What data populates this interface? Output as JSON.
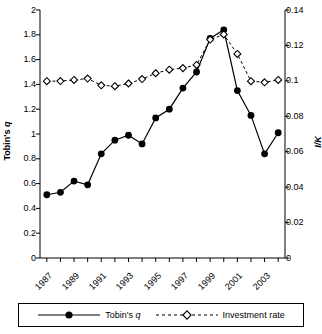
{
  "chart_data": {
    "type": "line",
    "title": "",
    "xlabel": "",
    "ylabel": "Tobin's q",
    "y2label": "I/K",
    "x": [
      1987,
      1988,
      1989,
      1990,
      1991,
      1992,
      1993,
      1994,
      1995,
      1996,
      1997,
      1998,
      1999,
      2000,
      2001,
      2002,
      2003,
      2004
    ],
    "xtick_labels": [
      "1987",
      "1989",
      "1991",
      "1993",
      "1995",
      "1997",
      "1999",
      "2001",
      "2003"
    ],
    "xtick_years": [
      1987,
      1989,
      1991,
      1993,
      1995,
      1997,
      1999,
      2001,
      2003
    ],
    "ylim": [
      0,
      2
    ],
    "ytick_labels": [
      "0",
      "0.2",
      "0.4",
      "0.6",
      "0.8",
      "1",
      "1.2",
      "1.4",
      "1.6",
      "1.8",
      "2"
    ],
    "ytick_values": [
      0,
      0.2,
      0.4,
      0.6,
      0.8,
      1,
      1.2,
      1.4,
      1.6,
      1.8,
      2
    ],
    "y2lim": [
      0,
      0.14
    ],
    "y2tick_labels": [
      "0",
      "0.02",
      "0.04",
      "0.06",
      "0.08",
      "0.1",
      "0.12",
      "0.14"
    ],
    "y2tick_values": [
      0,
      0.02,
      0.04,
      0.06,
      0.08,
      0.1,
      0.12,
      0.14
    ],
    "grid": false,
    "legend_position": "bottom",
    "series": [
      {
        "name": "Tobin's q",
        "axis": "left",
        "marker": "filled-circle",
        "line_style": "solid",
        "color": "#000000",
        "values": [
          0.51,
          0.53,
          0.62,
          0.59,
          0.84,
          0.95,
          0.99,
          0.92,
          1.13,
          1.2,
          1.37,
          1.5,
          1.77,
          1.84,
          1.35,
          1.15,
          0.84,
          1.01
        ]
      },
      {
        "name": "Investment rate",
        "axis": "right",
        "marker": "open-diamond",
        "line_style": "dashed",
        "color": "#000000",
        "values": [
          0.0998,
          0.0999,
          0.1005,
          0.1013,
          0.0975,
          0.097,
          0.0985,
          0.101,
          0.1043,
          0.1063,
          0.1072,
          0.109,
          0.1233,
          0.1262,
          0.1152,
          0.0998,
          0.0992,
          0.1005
        ]
      }
    ]
  },
  "legend": {
    "entries": [
      {
        "label": "Tobin's q",
        "marker": "filled-circle",
        "style": "solid"
      },
      {
        "label": "Investment rate",
        "marker": "open-diamond",
        "style": "dashed"
      }
    ]
  },
  "axes": {
    "left_title_main": "Tobin's",
    "left_title_italic": "q",
    "right_title": "I/K"
  }
}
